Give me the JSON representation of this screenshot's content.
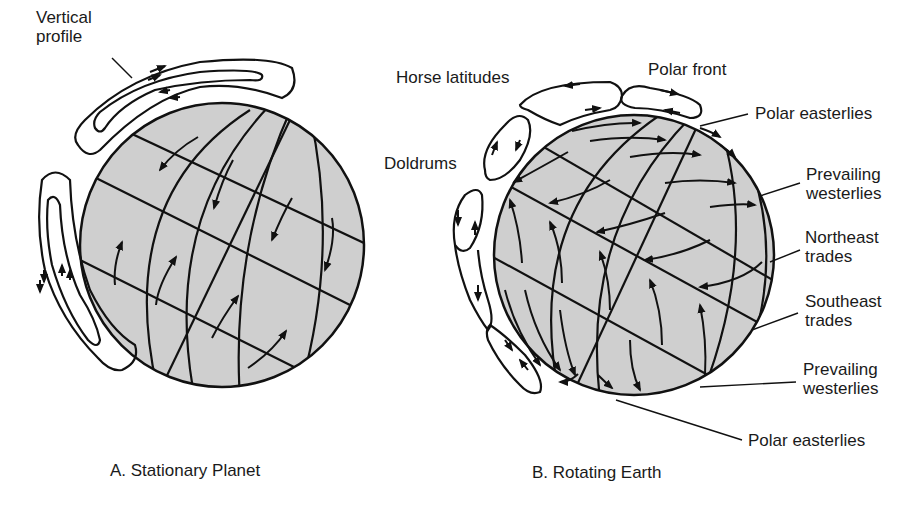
{
  "colors": {
    "globe_fill": "#cfcfcf",
    "stroke": "#111111",
    "background": "#ffffff"
  },
  "panel_a": {
    "caption": "A. Stationary Planet",
    "labels": {
      "vertical_profile_line1": "Vertical",
      "vertical_profile_line2": "profile"
    }
  },
  "panel_b": {
    "caption": "B. Rotating Earth",
    "labels": {
      "horse_latitudes": "Horse latitudes",
      "polar_front": "Polar front",
      "doldrums": "Doldrums",
      "polar_easterlies_top": "Polar easterlies",
      "prevailing_westerlies_top_1": "Prevailing",
      "prevailing_westerlies_top_2": "westerlies",
      "northeast_trades_1": "Northeast",
      "northeast_trades_2": "trades",
      "southeast_trades_1": "Southeast",
      "southeast_trades_2": "trades",
      "prevailing_westerlies_bottom_1": "Prevailing",
      "prevailing_westerlies_bottom_2": "westerlies",
      "polar_easterlies_bottom": "Polar easterlies"
    }
  }
}
